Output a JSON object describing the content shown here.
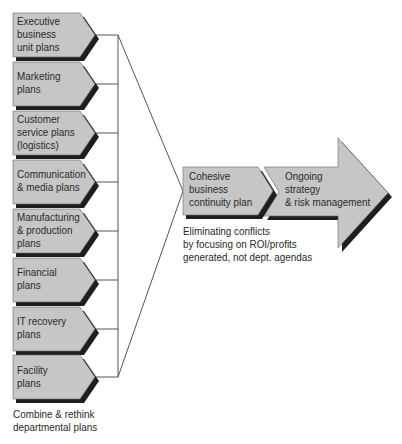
{
  "diagram": {
    "departmental_plans": [
      {
        "line1": "Executive",
        "line2": "business",
        "line3": "unit plans"
      },
      {
        "line1": "Marketing",
        "line2": "plans",
        "line3": ""
      },
      {
        "line1": "Customer",
        "line2": "service plans",
        "line3": "(logistics)"
      },
      {
        "line1": "Communication",
        "line2": "& media plans",
        "line3": ""
      },
      {
        "line1": "Manufacturing",
        "line2": "& production",
        "line3": "plans"
      },
      {
        "line1": "Financial",
        "line2": "plans",
        "line3": ""
      },
      {
        "line1": "IT recovery",
        "line2": "plans",
        "line3": ""
      },
      {
        "line1": "Facility",
        "line2": "plans",
        "line3": ""
      }
    ],
    "left_caption": {
      "line1": "Combine & rethink",
      "line2": "departmental plans"
    },
    "cohesive_plan": {
      "line1": "Cohesive",
      "line2": "business",
      "line3": "continuity plan"
    },
    "ongoing": {
      "line1": "Ongoing",
      "line2": "strategy",
      "line3": "& risk management"
    },
    "middle_caption": {
      "line1": "Eliminating conflicts",
      "line2": "by focusing on ROI/profits",
      "line3": "generated, not dept. agendas"
    },
    "colors": {
      "fill": "#c6c6c6",
      "shadow": "#1e1e1e",
      "line": "#555555",
      "text": "#2a2a2a"
    }
  }
}
